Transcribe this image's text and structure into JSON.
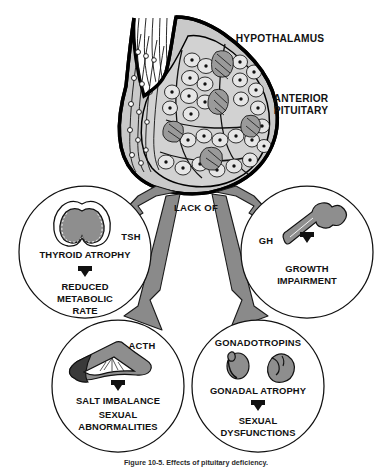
{
  "figure": {
    "title": "HYPOTHALAMUS",
    "anterior_pituitary_line1": "ANTERIOR",
    "anterior_pituitary_line2": "PITUITARY",
    "central_arrow_label": "LACK OF",
    "caption": "Figure 10-5.  Effects of pituitary deficiency."
  },
  "branches": [
    {
      "id": "tsh",
      "hormone": "TSH",
      "organ_icon": "thyroid-icon",
      "effect_primary": "THYROID ATROPHY",
      "effect_secondary_line1": "REDUCED",
      "effect_secondary_line2": "METABOLIC",
      "effect_secondary_line3": "RATE"
    },
    {
      "id": "gh",
      "hormone": "GH",
      "organ_icon": "bone-icon",
      "effect_primary": "",
      "effect_secondary_line1": "GROWTH",
      "effect_secondary_line2": "IMPAIRMENT",
      "effect_secondary_line3": ""
    },
    {
      "id": "acth",
      "hormone": "ACTH",
      "organ_icon": "adrenal-gland-icon",
      "effect_primary": "SALT IMBALANCE",
      "effect_secondary_line1": "SEXUAL",
      "effect_secondary_line2": "ABNORMALITIES",
      "effect_secondary_line3": ""
    },
    {
      "id": "gonadotropins",
      "hormone": "GONADOTROPINS",
      "organ_icon": "gonads-icon",
      "effect_primary": "GONADAL ATROPHY",
      "effect_secondary_line1": "SEXUAL",
      "effect_secondary_line2": "DYSFUNCTIONS",
      "effect_secondary_line3": ""
    }
  ],
  "colors": {
    "background": "#ffffff",
    "ink": "#111111",
    "arrow_gray": "#8a8a8a",
    "gland_gray": "#c9c9c9",
    "organ_gray": "#8e8e8e"
  }
}
